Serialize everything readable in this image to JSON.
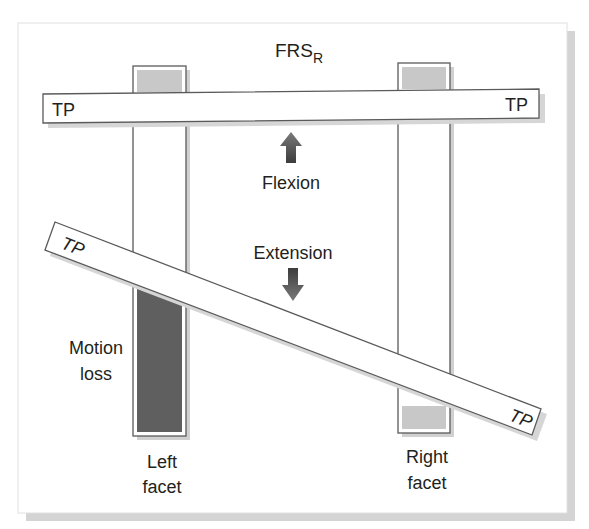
{
  "title": {
    "main": "FRS",
    "subscript": "R"
  },
  "bars": {
    "horizontal": {
      "left_label": "TP",
      "right_label": "TP"
    },
    "diagonal": {
      "left_label": "TP",
      "right_label": "TP"
    }
  },
  "arrows": {
    "up": {
      "label": "Flexion"
    },
    "down": {
      "label": "Extension"
    }
  },
  "facets": {
    "left": {
      "line1": "Left",
      "line2": "facet"
    },
    "right": {
      "line1": "Right",
      "line2": "facet"
    }
  },
  "annotation": {
    "line1": "Motion",
    "line2": "loss"
  },
  "colors": {
    "frame_shadow": "#d4d4d4",
    "outline": "#5a5a5a",
    "light_fill": "#c8c8c8",
    "dark_fill": "#5f5f5f",
    "arrow_fill": "#555555",
    "text": "#231f20"
  }
}
